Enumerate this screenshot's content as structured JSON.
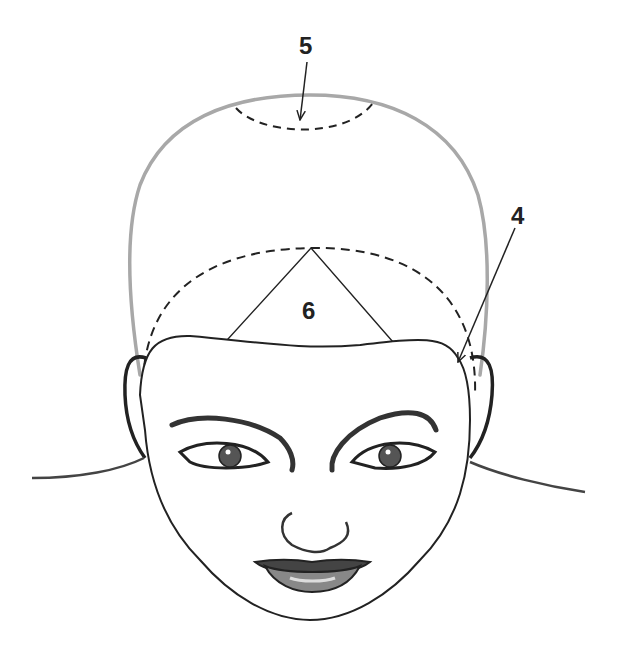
{
  "diagram": {
    "type": "head-sectioning-diagram",
    "view": "front view of head with face illustration",
    "labels": [
      {
        "id": "5",
        "text": "5",
        "target": "crown section (dashed arc at top of head)"
      },
      {
        "id": "4",
        "text": "4",
        "target": "side section boundary near right ear"
      },
      {
        "id": "6",
        "text": "6",
        "target": "triangular fringe/bang section at front hairline"
      }
    ],
    "colors": {
      "head_outline": "#a8a8a8",
      "line": "#222222",
      "background": "#ffffff"
    }
  }
}
